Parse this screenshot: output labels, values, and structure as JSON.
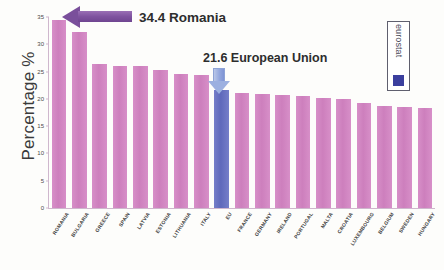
{
  "chart_data": {
    "type": "bar",
    "title": "",
    "xlabel": "",
    "ylabel": "Percentage %",
    "ylim": [
      0,
      35
    ],
    "yticks": [
      0,
      5,
      10,
      15,
      20,
      25,
      30,
      35
    ],
    "grid": false,
    "legend_position": "none",
    "categories": [
      "ROMANIA",
      "BULGARIA",
      "GREECE",
      "SPAIN",
      "LATVIA",
      "ESTONIA",
      "LITHUANIA",
      "ITALY",
      "EU",
      "FRANCE",
      "GERMANY",
      "IRELAND",
      "PORTUGAL",
      "MALTA",
      "CROATIA",
      "LUXEMBOURG",
      "BELGIUM",
      "SWEDEN",
      "HUNGARY"
    ],
    "values": [
      34.4,
      32.2,
      26.3,
      26.0,
      26.0,
      25.2,
      24.6,
      24.3,
      21.6,
      21.0,
      20.9,
      20.7,
      20.5,
      20.2,
      19.9,
      19.3,
      18.7,
      18.6,
      18.4
    ],
    "highlight_index": 8,
    "colors": {
      "bar": "#d288c2",
      "highlight_bar": "#6a73c2",
      "romania_arrow": "#7a4f9b",
      "eu_arrow": "#9cb0e0",
      "axis": "#cfb7cd",
      "text": "#2d2d2d",
      "logo_square": "#3b3f9e"
    },
    "annotations": [
      {
        "id": "romania",
        "text": "34.4 Romania",
        "value": 34.4,
        "target": "ROMANIA"
      },
      {
        "id": "european-union",
        "text": "21.6  European Union",
        "value": 21.6,
        "target": "EU"
      }
    ]
  },
  "logo": {
    "text": "eurostat"
  }
}
